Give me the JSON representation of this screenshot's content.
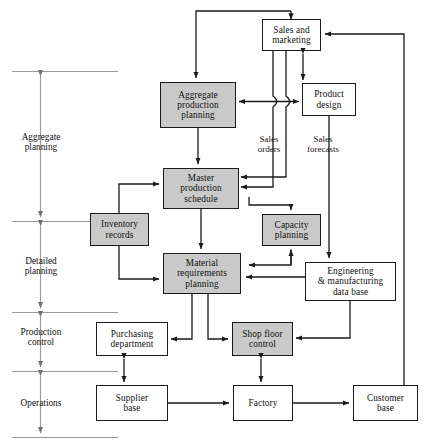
{
  "figure": {
    "type": "flow-diagram",
    "shaded_fill": "#c9c9c9",
    "plain_fill": "#ffffff",
    "stroke": "#1a1a1a",
    "axis_color": "#8c8c8c"
  },
  "axis": {
    "levels": [
      {
        "id": "aggregate-planning",
        "label_line1": "Aggregate",
        "label_line2": "planning"
      },
      {
        "id": "detailed-planning",
        "label_line1": "Detailed",
        "label_line2": "planning"
      },
      {
        "id": "production-control",
        "label_line1": "Production",
        "label_line2": "control"
      },
      {
        "id": "operations",
        "label_line1": "Operations",
        "label_line2": ""
      }
    ]
  },
  "nodes": {
    "sales_marketing": {
      "line1": "Sales and",
      "line2": "marketing",
      "line3": "",
      "shaded": false
    },
    "aggregate_production_planning": {
      "line1": "Aggregate",
      "line2": "production",
      "line3": "planning",
      "shaded": true
    },
    "product_design": {
      "line1": "Product",
      "line2": "design",
      "line3": "",
      "shaded": false
    },
    "master_production_schedule": {
      "line1": "Master",
      "line2": "production",
      "line3": "schedule",
      "shaded": true
    },
    "inventory_records": {
      "line1": "Inventory",
      "line2": "records",
      "line3": "",
      "shaded": true
    },
    "capacity_planning": {
      "line1": "Capacity",
      "line2": "planning",
      "line3": "",
      "shaded": true
    },
    "material_requirements_planning": {
      "line1": "Material",
      "line2": "requirements",
      "line3": "planning",
      "shaded": true
    },
    "engineering_manufacturing_data_base": {
      "line1": "Engineering",
      "line2": "& manufacturing",
      "line3": "data base",
      "shaded": false
    },
    "purchasing_department": {
      "line1": "Purchasing",
      "line2": "department",
      "line3": "",
      "shaded": false
    },
    "shop_floor_control": {
      "line1": "Shop floor",
      "line2": "control",
      "line3": "",
      "shaded": true
    },
    "supplier_base": {
      "line1": "Supplier",
      "line2": "base",
      "line3": "",
      "shaded": false
    },
    "factory": {
      "line1": "Factory",
      "line2": "",
      "line3": "",
      "shaded": false
    },
    "customer_base": {
      "line1": "Customer",
      "line2": "base",
      "line3": "",
      "shaded": false
    }
  },
  "edge_labels": {
    "sales_orders": {
      "line1": "Sales",
      "line2": "orders"
    },
    "sales_forecasts": {
      "line1": "Sales",
      "line2": "forecasts"
    }
  }
}
